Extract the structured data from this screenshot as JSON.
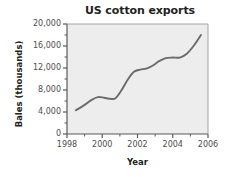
{
  "chart_data": {
    "type": "line",
    "title": "US cotton exports",
    "xlabel": "Year",
    "ylabel": "Bales (thousands)",
    "xlim": [
      1998,
      2006
    ],
    "ylim": [
      0,
      20000
    ],
    "grid": false,
    "legend": null,
    "background_color": "#ededed",
    "line_color": "#6b6b6b",
    "axis_color": "#58595b",
    "text_color": "#231f20",
    "x_ticks": [
      1998,
      1999,
      2000,
      2001,
      2002,
      2003,
      2004,
      2005,
      2006
    ],
    "x_tick_labels": [
      "1998",
      "",
      "2000",
      "",
      "2002",
      "",
      "2004",
      "",
      "2006"
    ],
    "x_major_labels": [
      "1998",
      "2000",
      "2002",
      "2004",
      "2006"
    ],
    "y_ticks": [
      0,
      2000,
      4000,
      6000,
      8000,
      10000,
      12000,
      14000,
      16000,
      18000,
      20000
    ],
    "y_tick_labels": [
      "0",
      "",
      "4,000",
      "",
      "8,000",
      "",
      "12,000",
      "",
      "16,000",
      "",
      "20,000"
    ],
    "y_major_labels": [
      "20,000",
      "16,000",
      "12,000",
      "8,000",
      "4,000",
      "0"
    ],
    "x": [
      1998.5,
      1999.0,
      1999.4,
      1999.75,
      2000.1,
      2000.45,
      2000.75,
      2001.1,
      2001.45,
      2001.8,
      2002.15,
      2002.5,
      2002.85,
      2003.2,
      2003.6,
      2004.0,
      2004.4,
      2004.8,
      2005.2,
      2005.6
    ],
    "values": [
      4300,
      5300,
      6200,
      6700,
      6600,
      6400,
      6500,
      8000,
      9900,
      11300,
      11700,
      11900,
      12400,
      13200,
      13800,
      13900,
      13900,
      14600,
      16100,
      18000
    ],
    "series": [
      {
        "name": "US cotton exports",
        "values": [
          4300,
          5300,
          6200,
          6700,
          6600,
          6400,
          6500,
          8000,
          9900,
          11300,
          11700,
          11900,
          12400,
          13200,
          13800,
          13900,
          13900,
          14600,
          16100,
          18000
        ]
      }
    ]
  }
}
